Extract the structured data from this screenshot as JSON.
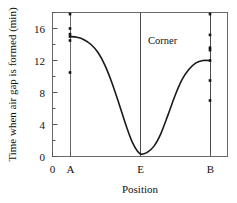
{
  "chart_data": {
    "type": "line",
    "title": "",
    "xlabel": "Position",
    "ylabel": "Time when air gap is formed (min)",
    "xlim": [
      0,
      1
    ],
    "ylim": [
      0,
      18
    ],
    "grid": false,
    "legend": null,
    "y_ticks": [
      0,
      4,
      8,
      12,
      16
    ],
    "y_tick_labels": [
      "0",
      "4",
      "8",
      "12",
      "16"
    ],
    "y_minor_ticks": [
      2,
      6,
      10,
      14,
      18
    ],
    "x_ticks": [
      0.0,
      0.1,
      0.5,
      0.9
    ],
    "x_tick_labels": [
      "0",
      "A",
      "E",
      "B"
    ],
    "annotations": [
      {
        "text": "Corner",
        "x": 0.56,
        "y": 14.2
      }
    ],
    "vertical_lines": [
      {
        "label": "A",
        "x": 0.1
      },
      {
        "label": "E",
        "x": 0.5
      },
      {
        "label": "B",
        "x": 0.9
      }
    ],
    "series": [
      {
        "name": "air gap formation time",
        "type": "line",
        "x": [
          0.1,
          0.14,
          0.18,
          0.22,
          0.26,
          0.3,
          0.34,
          0.38,
          0.42,
          0.46,
          0.5,
          0.54,
          0.58,
          0.62,
          0.66,
          0.7,
          0.74,
          0.78,
          0.82,
          0.86,
          0.9
        ],
        "values": [
          15.0,
          14.9,
          14.6,
          14.0,
          13.0,
          11.4,
          9.2,
          6.6,
          3.9,
          1.6,
          0.35,
          0.5,
          1.3,
          2.9,
          5.2,
          7.6,
          9.6,
          10.9,
          11.7,
          12.0,
          12.0
        ]
      },
      {
        "name": "measurements at A",
        "type": "scatter",
        "x": [
          0.1,
          0.1,
          0.1,
          0.1,
          0.1,
          0.1
        ],
        "values": [
          17.8,
          16.0,
          15.3,
          15.0,
          14.5,
          10.5
        ]
      },
      {
        "name": "measurements at B",
        "type": "scatter",
        "x": [
          0.9,
          0.9,
          0.9,
          0.9,
          0.9,
          0.9,
          0.9
        ],
        "values": [
          17.8,
          15.2,
          13.6,
          13.3,
          12.0,
          9.5,
          7.0
        ]
      }
    ]
  },
  "figure": {
    "axis_color": "#555555",
    "curve_color": "#1a1a1a",
    "marker_color": "#111111",
    "background": "#ffffff"
  }
}
